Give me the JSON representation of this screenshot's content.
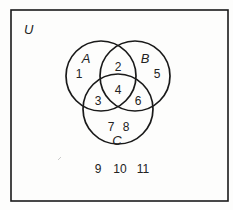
{
  "diagram": {
    "type": "venn",
    "universe": {
      "label": "U",
      "x": 11,
      "y": 10,
      "width": 217,
      "height": 191
    },
    "sets": [
      {
        "label": "A",
        "cx": 101,
        "cy": 76,
        "r": 35,
        "label_x": 86,
        "label_y": 63
      },
      {
        "label": "B",
        "cx": 135,
        "cy": 76,
        "r": 35,
        "label_x": 145,
        "label_y": 63
      },
      {
        "label": "C",
        "cx": 118,
        "cy": 109,
        "r": 35,
        "label_x": 117,
        "label_y": 145
      }
    ],
    "elements": [
      {
        "value": "1",
        "region": "A only",
        "x": 79,
        "y": 78
      },
      {
        "value": "2",
        "region": "A and B only",
        "x": 118,
        "y": 71
      },
      {
        "value": "5",
        "region": "B only",
        "x": 157,
        "y": 78
      },
      {
        "value": "4",
        "region": "A and B and C",
        "x": 118,
        "y": 94
      },
      {
        "value": "3",
        "region": "A and C only",
        "x": 98,
        "y": 105
      },
      {
        "value": "6",
        "region": "B and C only",
        "x": 138,
        "y": 105
      },
      {
        "value": "7",
        "region": "C only",
        "x": 111,
        "y": 131
      },
      {
        "value": "8",
        "region": "C only",
        "x": 126,
        "y": 131
      },
      {
        "value": "9",
        "region": "outside all sets",
        "x": 98,
        "y": 173
      },
      {
        "value": "10",
        "region": "outside all sets",
        "x": 120,
        "y": 173
      },
      {
        "value": "11",
        "region": "outside all sets",
        "x": 143,
        "y": 173
      }
    ],
    "stroke_color": "#1a1a1a"
  }
}
